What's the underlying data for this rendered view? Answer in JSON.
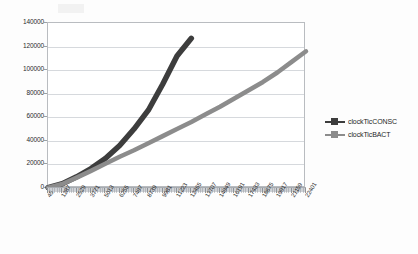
{
  "chart_data": {
    "type": "line",
    "title": "",
    "xlabel": "",
    "ylabel": "",
    "ylim": [
      0,
      140000
    ],
    "ytick_step": 20000,
    "ytick_labels": [
      "140000",
      "120000",
      "100000",
      "80000",
      "60000",
      "40000",
      "20000",
      "0"
    ],
    "ytick_values": [
      140000,
      120000,
      100000,
      80000,
      60000,
      40000,
      20000,
      0
    ],
    "grid": true,
    "legend_position": "right",
    "categories": [
      45,
      1287,
      2529,
      3771,
      5013,
      6255,
      7497,
      8739,
      9981,
      11223,
      12465,
      13707,
      14949,
      16191,
      17433,
      18675,
      19917,
      21159,
      22401
    ],
    "xtick_labels": [
      "45",
      "1287",
      "2529",
      "3771",
      "5013",
      "6255",
      "7497",
      "8739",
      "9981",
      "11223",
      "12465",
      "13707",
      "14949",
      "16191",
      "17433",
      "18675",
      "19917",
      "21159",
      "22401"
    ],
    "series": [
      {
        "name": "clockTicCONSC",
        "color": "#3d3d3d",
        "values": [
          300,
          3600,
          9500,
          16500,
          25000,
          36000,
          50000,
          66000,
          88000,
          112000,
          127000,
          null,
          null,
          null,
          null,
          null,
          null,
          null,
          null
        ]
      },
      {
        "name": "clockTicBACT",
        "color": "#8c8c8c",
        "values": [
          250,
          3400,
          8800,
          14500,
          20500,
          26500,
          32000,
          38000,
          44000,
          50000,
          56000,
          62500,
          69000,
          76000,
          83000,
          90000,
          98000,
          107000,
          116000
        ]
      }
    ]
  },
  "legend": {
    "items": [
      {
        "label": "clockTicCONSC",
        "color": "#3d3d3d"
      },
      {
        "label": "clockTicBACT",
        "color": "#8c8c8c"
      }
    ]
  }
}
